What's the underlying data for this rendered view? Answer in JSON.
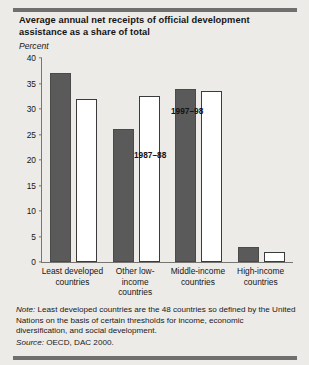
{
  "figure": {
    "title": "Average annual net receipts of official development assistance as a share of total",
    "subtitle": "Percent",
    "note_label": "Note:",
    "note_text": " Least developed countries are the 48 countries so defined by the United Nations on the basis of certain thresholds for income, economic diversification, and social development.",
    "source_label": "Source:",
    "source_text": " OECD, DAC 2000."
  },
  "colors": {
    "background": "#ecebe8",
    "rule": "#6f6f6f",
    "series_1987_88": "#5a5a5a",
    "series_1997_98": "#ffffff",
    "bar_outline": "#3b3b3b",
    "axis": "#77756f",
    "text": "#161616"
  },
  "annotations": {
    "series_a": "1987–88",
    "series_b": "1997–98"
  },
  "chart_data": {
    "type": "bar",
    "title": "Average annual net receipts of official development assistance as a share of total",
    "subtitle": "Percent",
    "xlabel": "",
    "ylabel": "Percent",
    "ylim": [
      0,
      40
    ],
    "yticks": [
      0,
      5,
      10,
      15,
      20,
      25,
      30,
      35,
      40
    ],
    "grid": false,
    "legend": "in-plot annotations",
    "categories": [
      "Least developed countries",
      "Other low-income countries",
      "Middle-income countries",
      "High-income countries"
    ],
    "series": [
      {
        "name": "1987–88",
        "values": [
          37,
          26,
          34,
          3
        ]
      },
      {
        "name": "1997–98",
        "values": [
          32,
          32.5,
          33.5,
          2
        ]
      }
    ]
  }
}
